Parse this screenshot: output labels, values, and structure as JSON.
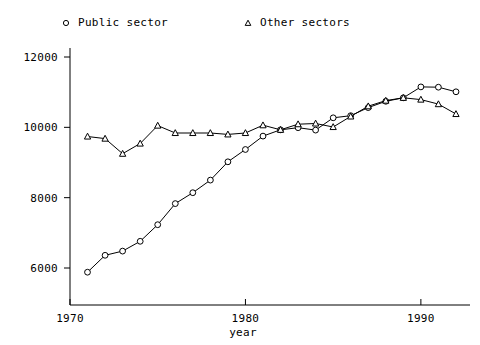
{
  "legend": {
    "items": [
      {
        "label": "Public sector",
        "marker": "circle-marker-icon",
        "color": "#000000"
      },
      {
        "label": "Other sectors",
        "marker": "triangle-marker-icon",
        "color": "#000000"
      }
    ]
  },
  "axes": {
    "x_title": "year",
    "x_ticks": [
      "1970",
      "1980",
      "1990"
    ],
    "y_ticks": [
      "6000",
      "8000",
      "10000",
      "12000"
    ]
  },
  "chart_data": {
    "type": "line",
    "title": "",
    "xlabel": "year",
    "ylabel": "",
    "xlim": [
      1970,
      1992.8
    ],
    "ylim": [
      5700,
      12300
    ],
    "grid": false,
    "legend_position": "top",
    "x": [
      1971,
      1972,
      1973,
      1974,
      1975,
      1976,
      1977,
      1978,
      1979,
      1980,
      1981,
      1982,
      1983,
      1984,
      1985,
      1986,
      1987,
      1988,
      1989,
      1990,
      1991,
      1992
    ],
    "series": [
      {
        "name": "Public sector",
        "marker": "circle",
        "values": [
          5880,
          6360,
          6480,
          6760,
          7230,
          7830,
          8140,
          8500,
          9020,
          9370,
          9750,
          9930,
          9990,
          9920,
          10270,
          10330,
          10560,
          10740,
          10840,
          11150,
          11140,
          11010
        ]
      },
      {
        "name": "Other sectors",
        "marker": "triangle",
        "values": [
          9740,
          9680,
          9250,
          9540,
          10050,
          9840,
          9840,
          9840,
          9800,
          9840,
          10060,
          9930,
          10090,
          10110,
          10010,
          10310,
          10600,
          10760,
          10840,
          10790,
          10660,
          10380
        ]
      }
    ]
  }
}
